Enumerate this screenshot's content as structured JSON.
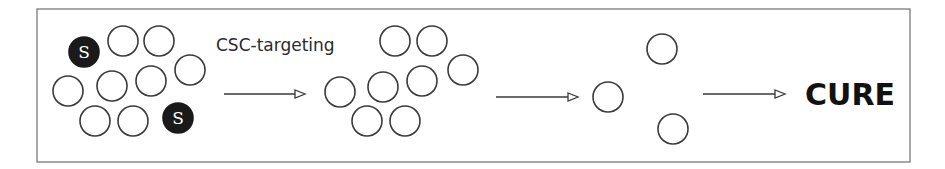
{
  "figure": {
    "frame": {
      "x": 37,
      "y": 9,
      "width": 873,
      "height": 153
    },
    "colors": {
      "frame": "#7a7a7a",
      "cell_stroke": "#3a3a3a",
      "stem_fill": "#1a1a1a",
      "text": "#111111"
    },
    "cell_radius": 15,
    "stages": [
      {
        "name": "initial-tumor",
        "cells": [
          {
            "x": 84,
            "y": 52,
            "type": "stem",
            "label": "S"
          },
          {
            "x": 123,
            "y": 41,
            "type": "normal"
          },
          {
            "x": 159,
            "y": 41,
            "type": "normal"
          },
          {
            "x": 190,
            "y": 70,
            "type": "normal"
          },
          {
            "x": 68,
            "y": 91,
            "type": "normal"
          },
          {
            "x": 112,
            "y": 86,
            "type": "normal"
          },
          {
            "x": 151,
            "y": 81,
            "type": "normal"
          },
          {
            "x": 95,
            "y": 121,
            "type": "normal"
          },
          {
            "x": 133,
            "y": 121,
            "type": "normal"
          },
          {
            "x": 178,
            "y": 118,
            "type": "stem",
            "label": "S"
          }
        ]
      },
      {
        "name": "after-csc-targeting",
        "cells": [
          {
            "x": 395,
            "y": 41,
            "type": "normal"
          },
          {
            "x": 432,
            "y": 41,
            "type": "normal"
          },
          {
            "x": 463,
            "y": 70,
            "type": "normal"
          },
          {
            "x": 340,
            "y": 92,
            "type": "normal"
          },
          {
            "x": 383,
            "y": 87,
            "type": "normal"
          },
          {
            "x": 422,
            "y": 81,
            "type": "normal"
          },
          {
            "x": 367,
            "y": 121,
            "type": "normal"
          },
          {
            "x": 405,
            "y": 121,
            "type": "normal"
          }
        ]
      },
      {
        "name": "residual-cells",
        "cells": [
          {
            "x": 662,
            "y": 49,
            "type": "normal"
          },
          {
            "x": 608,
            "y": 97,
            "type": "normal"
          },
          {
            "x": 673,
            "y": 129,
            "type": "normal"
          }
        ]
      }
    ],
    "arrows": [
      {
        "x1": 224,
        "x2": 305,
        "y": 94
      },
      {
        "x1": 496,
        "x2": 578,
        "y": 97
      },
      {
        "x1": 703,
        "x2": 785,
        "y": 94
      }
    ],
    "caption": {
      "text": "CSC-targeting",
      "x": 216,
      "y": 51
    },
    "outcome": {
      "text": "CURE",
      "x": 805,
      "y": 105
    }
  }
}
